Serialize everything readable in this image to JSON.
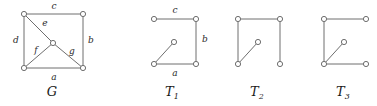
{
  "figure": {
    "background_color": "#ffffff",
    "stroke_color": "#6e6e6e",
    "text_color": "#1a1a1a",
    "node_fill": "#ffffff",
    "width": 377,
    "height": 106
  },
  "graphs": [
    {
      "id": "G",
      "caption": "ᵊ",
      "caption_plain": "G",
      "caption_x": 52,
      "caption_y": 96,
      "nodes": [
        {
          "name": "top-left",
          "x": 24,
          "y": 14
        },
        {
          "name": "top-right",
          "x": 83,
          "y": 14
        },
        {
          "name": "center",
          "x": 53,
          "y": 43
        },
        {
          "name": "bottom-left",
          "x": 24,
          "y": 68
        },
        {
          "name": "bottom-right",
          "x": 83,
          "y": 68
        }
      ],
      "edges": [
        {
          "name": "edge-c",
          "label": "c",
          "from": "top-left",
          "to": "top-right",
          "lx": 54,
          "ly": 9
        },
        {
          "name": "edge-b",
          "label": "b",
          "from": "top-right",
          "to": "bottom-right",
          "lx": 91,
          "ly": 43
        },
        {
          "name": "edge-a",
          "label": "a",
          "from": "bottom-left",
          "to": "bottom-right",
          "lx": 54,
          "ly": 80
        },
        {
          "name": "edge-d",
          "label": "d",
          "from": "top-left",
          "to": "bottom-left",
          "lx": 16,
          "ly": 43
        },
        {
          "name": "edge-e",
          "label": "e",
          "from": "top-left",
          "to": "center",
          "lx": 45,
          "ly": 26
        },
        {
          "name": "edge-f",
          "label": "f",
          "from": "center",
          "to": "bottom-left",
          "lx": 36,
          "ly": 53
        },
        {
          "name": "edge-g",
          "label": "g",
          "from": "center",
          "to": "bottom-right",
          "lx": 72,
          "ly": 54
        }
      ]
    },
    {
      "id": "T1",
      "caption": "ᵏ",
      "caption_plain": "T",
      "caption_sub": "1",
      "caption_x": 172,
      "caption_y": 96,
      "nodes": [
        {
          "name": "top-left",
          "x": 154,
          "y": 19
        },
        {
          "name": "top-right",
          "x": 196,
          "y": 19
        },
        {
          "name": "center",
          "x": 174,
          "y": 42
        },
        {
          "name": "bottom-left",
          "x": 154,
          "y": 64
        },
        {
          "name": "bottom-right",
          "x": 196,
          "y": 64
        }
      ],
      "edges": [
        {
          "name": "edge-c",
          "label": "c",
          "from": "top-left",
          "to": "top-right",
          "lx": 175,
          "ly": 13
        },
        {
          "name": "edge-b",
          "label": "b",
          "from": "top-right",
          "to": "bottom-right",
          "lx": 205,
          "ly": 42
        },
        {
          "name": "edge-a",
          "label": "a",
          "from": "bottom-left",
          "to": "bottom-right",
          "lx": 175,
          "ly": 76
        },
        {
          "name": "edge-diagonal",
          "label": "",
          "from": "bottom-left",
          "to": "center",
          "lx": 0,
          "ly": 0
        }
      ]
    },
    {
      "id": "T2",
      "caption": "ᵏ",
      "caption_plain": "T",
      "caption_sub": "2",
      "caption_x": 257,
      "caption_y": 96,
      "nodes": [
        {
          "name": "top-left",
          "x": 238,
          "y": 19
        },
        {
          "name": "top-right",
          "x": 280,
          "y": 19
        },
        {
          "name": "center",
          "x": 258,
          "y": 42
        },
        {
          "name": "bottom-left",
          "x": 238,
          "y": 64
        },
        {
          "name": "bottom-right",
          "x": 280,
          "y": 64
        }
      ],
      "edges": [
        {
          "name": "edge-c",
          "label": "",
          "from": "top-left",
          "to": "top-right",
          "lx": 0,
          "ly": 0
        },
        {
          "name": "edge-d",
          "label": "",
          "from": "top-left",
          "to": "bottom-left",
          "lx": 0,
          "ly": 0
        },
        {
          "name": "edge-b",
          "label": "",
          "from": "top-right",
          "to": "bottom-right",
          "lx": 0,
          "ly": 0
        },
        {
          "name": "edge-diagonal",
          "label": "",
          "from": "bottom-left",
          "to": "center",
          "lx": 0,
          "ly": 0
        }
      ]
    },
    {
      "id": "T3",
      "caption": "ᵏ",
      "caption_plain": "T",
      "caption_sub": "3",
      "caption_x": 343,
      "caption_y": 96,
      "nodes": [
        {
          "name": "top-left",
          "x": 324,
          "y": 19
        },
        {
          "name": "top-right",
          "x": 366,
          "y": 19
        },
        {
          "name": "center",
          "x": 344,
          "y": 42
        },
        {
          "name": "bottom-left",
          "x": 324,
          "y": 64
        },
        {
          "name": "bottom-right",
          "x": 366,
          "y": 64
        }
      ],
      "edges": [
        {
          "name": "edge-c",
          "label": "",
          "from": "top-left",
          "to": "top-right",
          "lx": 0,
          "ly": 0
        },
        {
          "name": "edge-d",
          "label": "",
          "from": "top-left",
          "to": "bottom-left",
          "lx": 0,
          "ly": 0
        },
        {
          "name": "edge-a",
          "label": "",
          "from": "bottom-left",
          "to": "bottom-right",
          "lx": 0,
          "ly": 0
        },
        {
          "name": "edge-diagonal",
          "label": "",
          "from": "bottom-left",
          "to": "center",
          "lx": 0,
          "ly": 0
        }
      ]
    }
  ]
}
